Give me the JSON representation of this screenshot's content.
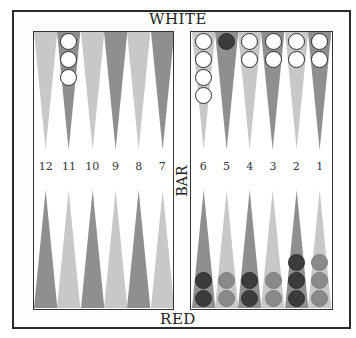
{
  "board": {
    "top_label": "WHITE",
    "bottom_label": "RED",
    "bar_label": "BAR",
    "colors": {
      "frame": "#2a2a2a",
      "point_light": "#c8c8c8",
      "point_dark": "#8f8f8f",
      "checker_white": "#ffffff",
      "checker_red_dark": "#3c3c3c",
      "checker_red_light": "#8a8a8a"
    },
    "point_numbers_left": [
      "12",
      "11",
      "10",
      "9",
      "8",
      "7"
    ],
    "point_numbers_right": [
      "6",
      "5",
      "4",
      "3",
      "2",
      "1"
    ],
    "top_points_left": [
      {
        "shade": "light",
        "checkers": []
      },
      {
        "shade": "dark",
        "checkers": [
          "white",
          "white",
          "white"
        ]
      },
      {
        "shade": "light",
        "checkers": []
      },
      {
        "shade": "dark",
        "checkers": []
      },
      {
        "shade": "light",
        "checkers": []
      },
      {
        "shade": "dark",
        "checkers": []
      }
    ],
    "top_points_right": [
      {
        "shade": "light",
        "checkers": [
          "white",
          "white",
          "white",
          "white"
        ]
      },
      {
        "shade": "dark",
        "checkers": [
          "red-dark"
        ]
      },
      {
        "shade": "light",
        "checkers": [
          "white",
          "white"
        ]
      },
      {
        "shade": "dark",
        "checkers": [
          "white",
          "white"
        ]
      },
      {
        "shade": "light",
        "checkers": [
          "white",
          "white"
        ]
      },
      {
        "shade": "dark",
        "checkers": [
          "white",
          "white"
        ]
      }
    ],
    "bottom_points_left": [
      {
        "point": "12",
        "shade": "dark",
        "checkers": []
      },
      {
        "point": "11",
        "shade": "light",
        "checkers": []
      },
      {
        "point": "10",
        "shade": "dark",
        "checkers": []
      },
      {
        "point": "9",
        "shade": "light",
        "checkers": []
      },
      {
        "point": "8",
        "shade": "dark",
        "checkers": []
      },
      {
        "point": "7",
        "shade": "light",
        "checkers": []
      }
    ],
    "bottom_points_right": [
      {
        "point": "6",
        "shade": "dark",
        "checkers": [
          "red-dark",
          "red-dark"
        ]
      },
      {
        "point": "5",
        "shade": "light",
        "checkers": [
          "red-light",
          "red-light"
        ]
      },
      {
        "point": "4",
        "shade": "dark",
        "checkers": [
          "red-dark",
          "red-dark"
        ]
      },
      {
        "point": "3",
        "shade": "light",
        "checkers": [
          "red-light",
          "red-light"
        ]
      },
      {
        "point": "2",
        "shade": "dark",
        "checkers": [
          "red-dark",
          "red-dark",
          "red-dark"
        ]
      },
      {
        "point": "1",
        "shade": "light",
        "checkers": [
          "red-light",
          "red-light",
          "red-light"
        ]
      }
    ]
  }
}
